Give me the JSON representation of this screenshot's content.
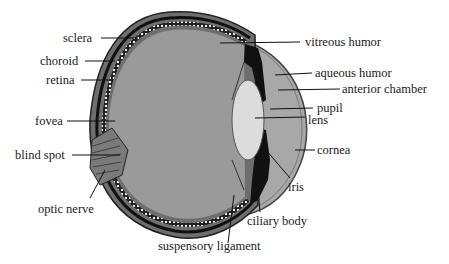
{
  "diagram": {
    "colors": {
      "interior": "#9a9a9a",
      "lens": "#dcdcdc",
      "aqueous": "#a8a8a8",
      "sclera_wall": "#6e6e6e",
      "dark_structures": "#111111",
      "text": "#1a1a1a"
    },
    "labels": {
      "sclera": "sclera",
      "choroid": "choroid",
      "retina": "retina",
      "fovea": "fovea",
      "blind_spot": "blind spot",
      "optic_nerve": "optic nerve",
      "vitreous_humor": "vitreous humor",
      "aqueous_humor": "aqueous humor",
      "anterior_chamber": "anterior chamber",
      "pupil": "pupil",
      "lens": "lens",
      "cornea": "cornea",
      "iris": "iris",
      "ciliary_body": "ciliary body",
      "suspensory_ligament": "suspensory ligament"
    }
  }
}
